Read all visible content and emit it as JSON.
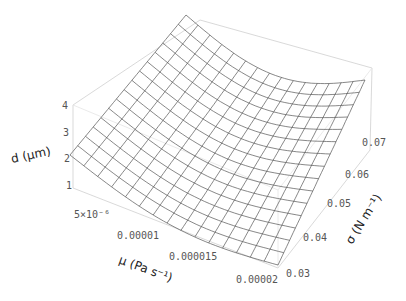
{
  "chart_data": {
    "type": "surface3d",
    "title": "",
    "xlabel": "μ (Pa s⁻¹)",
    "ylabel": "σ (N m⁻¹)",
    "zlabel": "d (μm)",
    "x_ticks": [
      "5×10⁻⁶",
      "0.00001",
      "0.000015",
      "0.00002"
    ],
    "y_ticks": [
      "0.03",
      "0.04",
      "0.05",
      "0.06",
      "0.07"
    ],
    "z_ticks": [
      "1",
      "2",
      "3",
      "4"
    ],
    "xlim": [
      2e-06,
      2e-05
    ],
    "ylim": [
      0.03,
      0.075
    ],
    "zlim": [
      1,
      4
    ],
    "mesh": {
      "rows": 15,
      "cols": 15
    },
    "corner_values": {
      "mu_min_sigma_min": 2.6,
      "mu_min_sigma_max": 4.0,
      "mu_max_sigma_min": 1.0,
      "mu_max_sigma_max": 1.8
    }
  },
  "labels": {
    "z_axis": "d (μm)",
    "x_axis": "μ (Pa s⁻¹)",
    "y_axis": "σ (N m⁻¹)",
    "z_ticks": [
      "1",
      "2",
      "3",
      "4"
    ],
    "x_ticks": [
      "5×10⁻⁶",
      "0.00001",
      "0.000015",
      "0.00002"
    ],
    "y_ticks": [
      "0.03",
      "0.04",
      "0.05",
      "0.06",
      "0.07"
    ]
  }
}
